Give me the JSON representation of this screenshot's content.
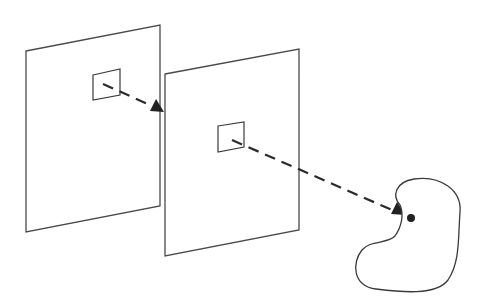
{
  "diagram": {
    "colors": {
      "background": "#ffffff",
      "line": "#4a4a4a",
      "arrow": "#222222"
    },
    "layers": [
      {
        "id": "layer-1",
        "corners": [
          [
            26,
            51
          ],
          [
            160,
            25
          ],
          [
            160,
            206
          ],
          [
            26,
            232
          ]
        ],
        "patch": [
          [
            93,
            75
          ],
          [
            120,
            69
          ],
          [
            120,
            95
          ],
          [
            93,
            100
          ]
        ]
      },
      {
        "id": "layer-2",
        "corners": [
          [
            165,
            74
          ],
          [
            299,
            49
          ],
          [
            299,
            230
          ],
          [
            165,
            256
          ]
        ],
        "patch": [
          [
            218,
            126
          ],
          [
            244,
            122
          ],
          [
            244,
            147
          ],
          [
            218,
            152
          ]
        ]
      }
    ],
    "arrows": [
      {
        "id": "arrow-layer1-to-layer2",
        "from": [
          103,
          84
        ],
        "to": [
          161,
          110
        ],
        "style": "dashed"
      },
      {
        "id": "arrow-layer2-to-region",
        "from": [
          232,
          140
        ],
        "to": [
          404,
          215
        ],
        "style": "dashed"
      }
    ],
    "region": {
      "id": "output-region",
      "target_point": [
        411,
        218
      ]
    }
  }
}
